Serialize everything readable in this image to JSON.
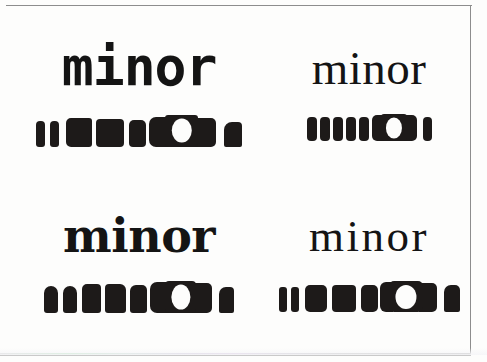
{
  "figure": {
    "name": "typeface-legibility-specimen-figure",
    "background_color": "#fdfdfc",
    "ink_color": "#1d1a19",
    "border_color": "#8d8d8d",
    "specimen_word": "minor"
  },
  "specimens": [
    {
      "id": "top-left",
      "position": "top-left",
      "word": "minor",
      "style_name": "typewriter-slab-monospace",
      "blob_count": 8,
      "blobs": [
        {
          "w": 9,
          "h": 26,
          "r": "4px 4px 3px 3px",
          "kind": "solid"
        },
        {
          "w": 9,
          "h": 26,
          "r": "4px 4px 3px 3px",
          "kind": "solid"
        },
        {
          "w": 26,
          "h": 29,
          "r": "5px 3px 3px 5px",
          "kind": "solid"
        },
        {
          "w": 28,
          "h": 28,
          "r": "4px 4px 4px 4px",
          "kind": "solid"
        },
        {
          "w": 17,
          "h": 27,
          "r": "5px 5px 4px 4px",
          "kind": "solid"
        },
        {
          "w": 22,
          "h": 30,
          "r": "6px 2px 2px 6px",
          "kind": "notch-right"
        },
        {
          "w": 33,
          "h": 32,
          "r": "4px",
          "kind": "ring"
        },
        {
          "w": 18,
          "h": 25,
          "r": "7px 4px 2px 2px",
          "kind": "solid"
        }
      ]
    },
    {
      "id": "top-right",
      "position": "top-right",
      "word": "minor",
      "style_name": "transitional-serif",
      "blob_count": 8,
      "blobs": [
        {
          "w": 9,
          "h": 24,
          "r": "4px",
          "kind": "solid"
        },
        {
          "w": 9,
          "h": 24,
          "r": "4px",
          "kind": "solid"
        },
        {
          "w": 10,
          "h": 24,
          "r": "4px",
          "kind": "solid"
        },
        {
          "w": 10,
          "h": 24,
          "r": "4px",
          "kind": "solid"
        },
        {
          "w": 10,
          "h": 24,
          "r": "4px",
          "kind": "solid"
        },
        {
          "w": 13,
          "h": 26,
          "r": "5px 2px 2px 5px",
          "kind": "notch-right"
        },
        {
          "w": 26,
          "h": 27,
          "r": "4px",
          "kind": "ring"
        },
        {
          "w": 9,
          "h": 24,
          "r": "4px",
          "kind": "solid"
        }
      ]
    },
    {
      "id": "bottom-left",
      "position": "bottom-left",
      "word": "minor",
      "style_name": "slab-serif-clarendon",
      "blob_count": 8,
      "blobs": [
        {
          "w": 14,
          "h": 27,
          "r": "6px 6px 3px 3px",
          "kind": "solid"
        },
        {
          "w": 14,
          "h": 27,
          "r": "6px 6px 3px 3px",
          "kind": "solid"
        },
        {
          "w": 19,
          "h": 29,
          "r": "5px 4px 3px 3px",
          "kind": "solid"
        },
        {
          "w": 21,
          "h": 29,
          "r": "4px 5px 3px 3px",
          "kind": "solid"
        },
        {
          "w": 17,
          "h": 28,
          "r": "5px 5px 3px 3px",
          "kind": "solid"
        },
        {
          "w": 21,
          "h": 31,
          "r": "6px 2px 2px 6px",
          "kind": "notch-right"
        },
        {
          "w": 31,
          "h": 32,
          "r": "4px",
          "kind": "ring"
        },
        {
          "w": 15,
          "h": 26,
          "r": "6px 4px 2px 2px",
          "kind": "solid"
        }
      ]
    },
    {
      "id": "bottom-right",
      "position": "bottom-right",
      "word": "minor",
      "style_name": "modern-high-contrast-serif",
      "blob_count": 7,
      "blobs": [
        {
          "w": 8,
          "h": 25,
          "r": "3px",
          "kind": "solid"
        },
        {
          "w": 8,
          "h": 25,
          "r": "3px",
          "kind": "solid"
        },
        {
          "w": 22,
          "h": 27,
          "r": "5px",
          "kind": "solid"
        },
        {
          "w": 24,
          "h": 27,
          "r": "4px",
          "kind": "solid"
        },
        {
          "w": 17,
          "h": 27,
          "r": "5px",
          "kind": "solid"
        },
        {
          "w": 34,
          "h": 31,
          "r": "5px",
          "kind": "ring"
        },
        {
          "w": 16,
          "h": 27,
          "r": "6px 5px 2px 2px",
          "kind": "solid"
        }
      ]
    }
  ]
}
